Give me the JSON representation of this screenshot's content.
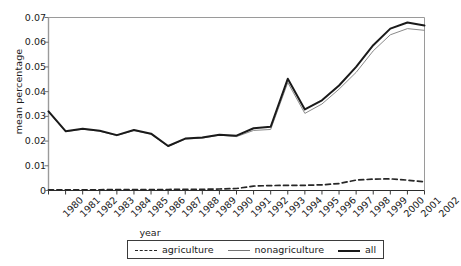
{
  "chart_data": {
    "type": "line",
    "title": "",
    "xlabel": "year",
    "ylabel": "mean percentage",
    "x": [
      1980,
      1981,
      1982,
      1983,
      1984,
      1985,
      1986,
      1987,
      1988,
      1989,
      1990,
      1991,
      1992,
      1993,
      1994,
      1995,
      1996,
      1997,
      1998,
      1999,
      2000,
      2001,
      2002
    ],
    "xtick_labels": [
      "1980",
      "1981",
      "1982",
      "1983",
      "1984",
      "1985",
      "1986",
      "1987",
      "1988",
      "1989",
      "1990",
      "1991",
      "1992",
      "1993",
      "1994",
      "1995",
      "1996",
      "1997",
      "1998",
      "1999",
      "2000",
      "2001",
      "2002"
    ],
    "ytick_labels": [
      "0.07",
      "0.06",
      "0.05",
      "0.04",
      "0.03",
      "0.02",
      "0.01",
      "0"
    ],
    "ytick_values": [
      0.07,
      0.06,
      0.05,
      0.04,
      0.03,
      0.02,
      0.01,
      0
    ],
    "xlim": [
      1980,
      2002
    ],
    "ylim": [
      0,
      0.07
    ],
    "grid": false,
    "legend_position": "below-center",
    "series": [
      {
        "name": "agriculture",
        "style": "dashed",
        "color": "#262626",
        "values": [
          0.0003,
          0.0003,
          0.0003,
          0.0003,
          0.0004,
          0.0004,
          0.0004,
          0.0004,
          0.0005,
          0.0005,
          0.0006,
          0.0008,
          0.0018,
          0.002,
          0.0021,
          0.0021,
          0.0023,
          0.0028,
          0.0042,
          0.0046,
          0.0047,
          0.0042,
          0.0035
        ]
      },
      {
        "name": "nonagriculture",
        "style": "solid-thin",
        "color": "#8a8a8a",
        "values": [
          0.0318,
          0.0238,
          0.0248,
          0.024,
          0.0222,
          0.0243,
          0.0228,
          0.0178,
          0.0208,
          0.0212,
          0.0224,
          0.0218,
          0.0243,
          0.0247,
          0.0437,
          0.0312,
          0.035,
          0.041,
          0.0478,
          0.0565,
          0.063,
          0.0655,
          0.0648
        ]
      },
      {
        "name": "all",
        "style": "solid-thick",
        "color": "#1a1a1a",
        "values": [
          0.032,
          0.024,
          0.025,
          0.0242,
          0.0224,
          0.0245,
          0.023,
          0.018,
          0.021,
          0.0214,
          0.0226,
          0.0222,
          0.0252,
          0.0258,
          0.0452,
          0.0328,
          0.0365,
          0.0425,
          0.05,
          0.0588,
          0.0655,
          0.068,
          0.0668
        ]
      }
    ]
  },
  "legend": {
    "entries": [
      {
        "label": "agriculture"
      },
      {
        "label": "nonagriculture"
      },
      {
        "label": "all"
      }
    ]
  }
}
